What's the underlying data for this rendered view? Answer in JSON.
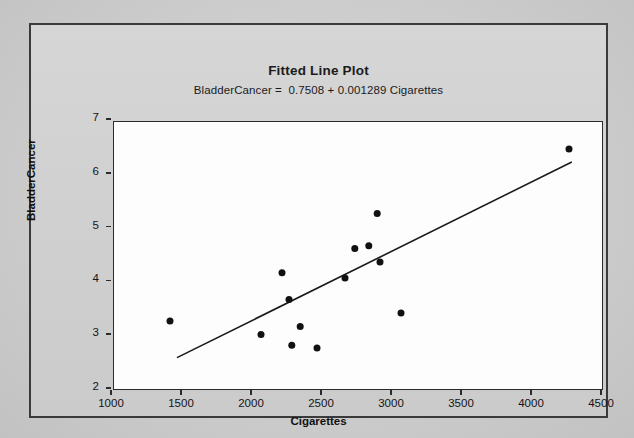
{
  "figure": {
    "title": "Fitted Line Plot",
    "subtitle": "BladderCancer =  0.7508 + 0.001289 Cigarettes",
    "bleed_text": {
      "line1": "the page reverse side show-through",
      "line2": "text",
      "line3": "faint"
    }
  },
  "chart_data": {
    "type": "scatter",
    "title": "Fitted Line Plot",
    "subtitle": "BladderCancer =  0.7508 + 0.001289 Cigarettes",
    "xlabel": "Cigarettes",
    "ylabel": "BladderCancer",
    "xlim": [
      1000,
      4500
    ],
    "ylim": [
      2,
      7
    ],
    "xticks": [
      1000,
      1500,
      2000,
      2500,
      3000,
      3500,
      4000,
      4500
    ],
    "yticks": [
      2,
      3,
      4,
      5,
      6,
      7
    ],
    "xtick_labels": [
      "1000",
      "1500",
      "2000",
      "2500",
      "3000",
      "3500",
      "4000",
      "4500"
    ],
    "ytick_labels": [
      "2",
      "3",
      "4",
      "5",
      "6",
      "7"
    ],
    "grid": false,
    "legend": null,
    "marker": {
      "shape": "circle",
      "color": "#111111",
      "size": 7
    },
    "points": [
      {
        "x": 1400,
        "y": 3.3
      },
      {
        "x": 2050,
        "y": 3.05
      },
      {
        "x": 2200,
        "y": 4.2
      },
      {
        "x": 2250,
        "y": 3.7
      },
      {
        "x": 2270,
        "y": 2.85
      },
      {
        "x": 2330,
        "y": 3.2
      },
      {
        "x": 2450,
        "y": 2.8
      },
      {
        "x": 2650,
        "y": 4.1
      },
      {
        "x": 2720,
        "y": 4.65
      },
      {
        "x": 2820,
        "y": 4.7
      },
      {
        "x": 2880,
        "y": 5.3
      },
      {
        "x": 2900,
        "y": 4.4
      },
      {
        "x": 3050,
        "y": 3.45
      },
      {
        "x": 4250,
        "y": 6.5
      }
    ],
    "fit_line": {
      "equation": "BladderCancer =  0.7508 + 0.001289 Cigarettes",
      "intercept": 0.7508,
      "slope": 0.001289,
      "x_start": 1450,
      "x_end": 4270,
      "color": "#1a1a1a",
      "width": 1.6
    }
  }
}
